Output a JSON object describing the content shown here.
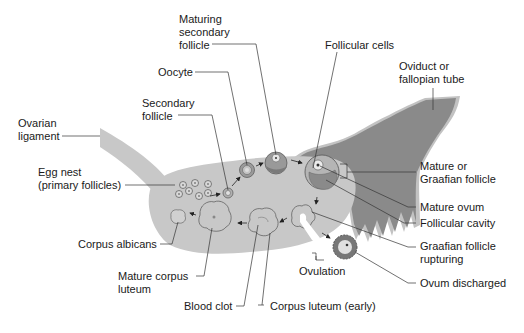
{
  "diagram": {
    "type": "anatomical-diagram",
    "colors": {
      "ovary": "#c8c8c8",
      "ligament": "#c8c8c8",
      "oviduct": "#8a8a8a",
      "oviduct_edge": "#c0c0c0",
      "follicle_dark": "#8c8c8c",
      "follicle_light": "#d6d6d6",
      "leader_line": "#333333",
      "text": "#1a1a1a"
    },
    "labels": {
      "maturing_secondary_follicle": [
        "Maturing",
        "secondary",
        "follicle"
      ],
      "oocyte": "Oocyte",
      "follicular_cells": "Follicular cells",
      "oviduct": [
        "Oviduct or",
        "fallopian tube"
      ],
      "secondary_follicle": [
        "Secondary",
        "follicle"
      ],
      "ovarian_ligament": [
        "Ovarian",
        "ligament"
      ],
      "egg_nest": [
        "Egg nest",
        "(primary follicles)"
      ],
      "mature_graafian_follicle": [
        "Mature or",
        "Graafian follicle"
      ],
      "mature_ovum": "Mature ovum",
      "follicular_cavity": "Follicular cavity",
      "graafian_follicle_rupturing": [
        "Graafian follicle",
        "rupturing"
      ],
      "corpus_albicans": "Corpus albicans",
      "ovulation": "Ovulation",
      "ovum_discharged": "Ovum discharged",
      "mature_corpus_luteum": [
        "Mature corpus",
        "luteum"
      ],
      "blood_clot": "Blood clot",
      "corpus_luteum_early": "Corpus luteum (early)"
    },
    "stages_sequence": [
      "Egg nest (primary follicles)",
      "Secondary follicle",
      "Maturing secondary follicle",
      "Mature or Graafian follicle",
      "Graafian follicle rupturing",
      "Ovulation",
      "Corpus luteum (early)",
      "Mature corpus luteum",
      "Corpus albicans"
    ]
  }
}
